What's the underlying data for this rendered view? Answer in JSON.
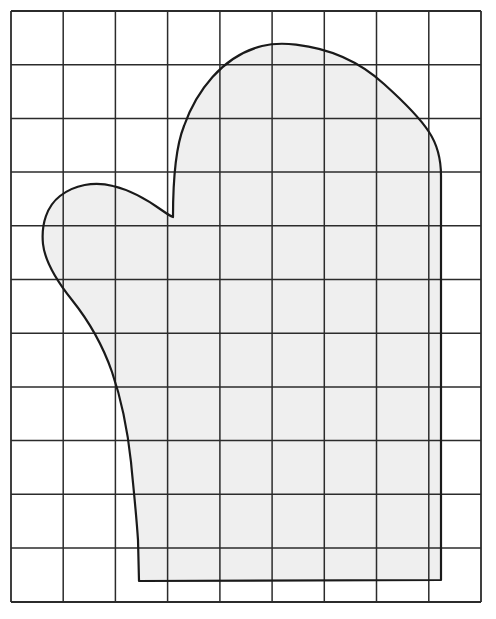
{
  "document": {
    "kind": "scale-drawing",
    "subject": "mitten-pattern",
    "caption": "",
    "background_color": "#ffffff"
  },
  "grid": {
    "name": "squared-grid-overlay",
    "columns": 9,
    "rows": 11,
    "x_left": 11,
    "x_right": 481,
    "y_top": 11,
    "y_bottom": 602,
    "cell_width": 52.2,
    "cell_height": 53.7,
    "line_color": "#2b2b2b",
    "line_width": 1.5,
    "border_line_width": 1.8,
    "x_lines": [
      11,
      63.2,
      115.4,
      167.6,
      219.9,
      272.1,
      324.3,
      376.5,
      428.8,
      481
    ],
    "y_lines": [
      11,
      64.7,
      118.4,
      172.1,
      225.8,
      279.5,
      333.2,
      386.9,
      440.6,
      494.3,
      548,
      602
    ]
  },
  "shape": {
    "name": "mitten-outline",
    "fill_color": "#efefef",
    "stroke_color": "#1a1a1a",
    "stroke_width": 2.2,
    "key_points": {
      "dome_apex": [
        286,
        44
      ],
      "right_edge_x": 441,
      "right_shoulder_start": [
        420,
        78
      ],
      "right_straight_top": [
        441,
        110
      ],
      "bottom_right": [
        441,
        580
      ],
      "bottom_left": [
        139,
        581
      ],
      "cuff_left_top": [
        131,
        462
      ],
      "thumb_crotch": [
        173,
        217
      ],
      "cuff_inner_x": 173,
      "thumb_apex": [
        115,
        186
      ],
      "thumb_left_extreme": [
        43,
        243
      ]
    },
    "path": "M 173 217 C 173 180 176 146 184 126 C 196 92 222 56 262 46 C 272 43.5 284 43.2 296 44.6 C 330 48.5 360 62 384 84 C 404 102 420 118 429 132 C 437 144 441 158 441 176 L 441 580 L 139 581 L 138 540 C 136 510 133 484 131 462 C 128 434 123 404 112 372 C 103 346 88 320 72 300 C 56 280 45 262 43 244 C 41 224 47 206 60 196 C 74 185 94 181 113 186 C 134 191 152 203 163 211 C 168 214.5 171 216.2 173 217 Z"
  },
  "icons": {
    "grid": "grid-icon",
    "shape": "mitten-icon"
  }
}
